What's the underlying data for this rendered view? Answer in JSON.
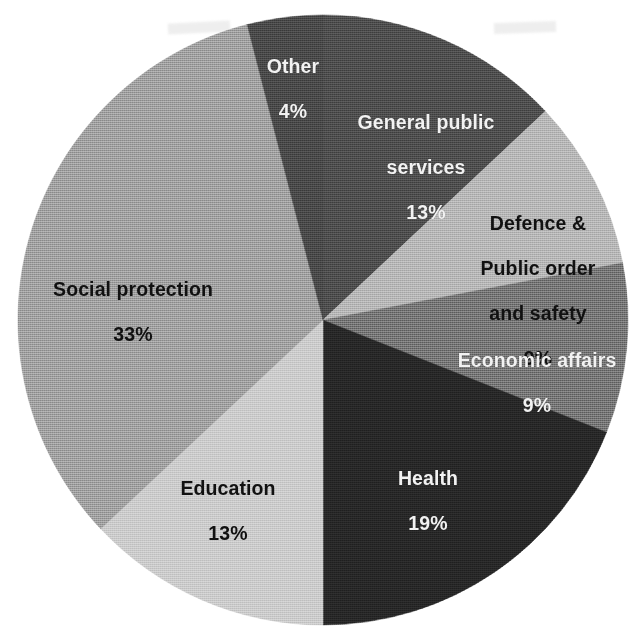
{
  "chart_data": {
    "type": "pie",
    "title": "",
    "subtitle": "",
    "xlabel": "",
    "ylabel": "",
    "legend_position": "none",
    "grid": false,
    "value_unit": "%",
    "total": 100,
    "start_angle_deg": 0,
    "direction": "clockwise",
    "categories": [
      "General public services",
      "Defence & Public order and safety",
      "Economic affairs",
      "Health",
      "Education",
      "Social protection",
      "Other"
    ],
    "values": [
      13,
      9,
      9,
      19,
      13,
      33,
      4
    ],
    "slices": [
      {
        "label": "General public services",
        "label_line1": "General public",
        "label_line2": "services",
        "value": 13,
        "percent_text": "13%",
        "color": "#4a4a4a",
        "text_color": "#f2f2f2"
      },
      {
        "label": "Defence & Public order and safety",
        "label_line1": "Defence &",
        "label_line2": "Public order",
        "label_line3": "and safety",
        "value": 9,
        "percent_text": "9%",
        "color": "#b2b2b2",
        "text_color": "#111111"
      },
      {
        "label": "Economic affairs",
        "label_line1": "Economic affairs",
        "value": 9,
        "percent_text": "9%",
        "color": "#707070",
        "text_color": "#f2f2f2"
      },
      {
        "label": "Health",
        "label_line1": "Health",
        "value": 19,
        "percent_text": "19%",
        "color": "#262626",
        "text_color": "#f2f2f2"
      },
      {
        "label": "Education",
        "label_line1": "Education",
        "value": 13,
        "percent_text": "13%",
        "color": "#c8c8c8",
        "text_color": "#111111"
      },
      {
        "label": "Social protection",
        "label_line1": "Social protection",
        "value": 33,
        "percent_text": "33%",
        "color": "#9b9b9b",
        "text_color": "#111111"
      },
      {
        "label": "Other",
        "label_line1": "Other",
        "value": 4,
        "percent_text": "4%",
        "color": "#464646",
        "text_color": "#f2f2f2"
      }
    ]
  },
  "labels": {
    "general_public_services": {
      "line1": "General public",
      "line2": "services",
      "percent": "13%"
    },
    "defence_public_order": {
      "line1": "Defence &",
      "line2": "Public order",
      "line3": "and safety",
      "percent": "9%"
    },
    "economic_affairs": {
      "line1": "Economic affairs",
      "percent": "9%"
    },
    "health": {
      "line1": "Health",
      "percent": "19%"
    },
    "education": {
      "line1": "Education",
      "percent": "13%"
    },
    "social_protection": {
      "line1": "Social protection",
      "percent": "33%"
    },
    "other": {
      "line1": "Other",
      "percent": "4%"
    }
  }
}
